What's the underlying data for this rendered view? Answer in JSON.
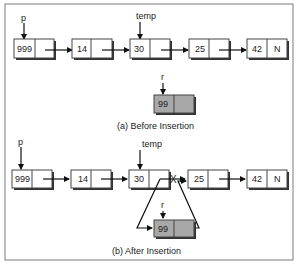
{
  "figure": {
    "border_color": "#7a7a7a",
    "panels": [
      {
        "caption": "(a) Before Insertion",
        "list_nodes": [
          {
            "value": "999",
            "next": ""
          },
          {
            "value": "14",
            "next": ""
          },
          {
            "value": "30",
            "next": ""
          },
          {
            "value": "25",
            "next": ""
          },
          {
            "value": "42",
            "next": "N"
          }
        ],
        "pointers": {
          "p": "p",
          "temp": "temp",
          "r": "r"
        },
        "new_node": {
          "value": "99",
          "next": "",
          "fill": "#a8a8a8"
        }
      },
      {
        "caption": "(b) After Insertion",
        "list_nodes": [
          {
            "value": "999",
            "next": ""
          },
          {
            "value": "14",
            "next": ""
          },
          {
            "value": "30",
            "next": ""
          },
          {
            "value": "25",
            "next": ""
          },
          {
            "value": "42",
            "next": "N"
          }
        ],
        "pointers": {
          "p": "p",
          "temp": "temp",
          "r": "r"
        },
        "new_node": {
          "value": "99",
          "next": "",
          "fill": "#a8a8a8"
        },
        "broken_link_mark": "X"
      }
    ]
  }
}
